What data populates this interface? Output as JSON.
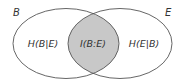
{
  "diagram": {
    "type": "venn",
    "sets": [
      {
        "name": "B",
        "label": "B"
      },
      {
        "name": "E",
        "label": "E"
      }
    ],
    "regions": {
      "left_only": "H(B|E)",
      "intersection": "I(B:E)",
      "right_only": "H(E|B)"
    },
    "colors": {
      "outline": "#555555",
      "intersection_fill": "#c8c8c8",
      "background": "#ffffff",
      "text": "#333333"
    }
  }
}
